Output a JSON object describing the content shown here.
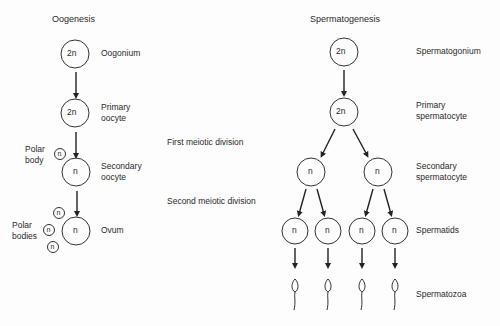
{
  "oogenesis": {
    "title": "Oogenesis",
    "stages": [
      {
        "label": "Oogonium",
        "ploidy": "2n"
      },
      {
        "label_line1": "Primary",
        "label_line2": "oocyte",
        "ploidy": "2n"
      },
      {
        "label_line1": "Secondary",
        "label_line2": "oocyte",
        "ploidy": "n"
      },
      {
        "label": "Ovum",
        "ploidy": "n"
      }
    ],
    "polar_body": {
      "line1": "Polar",
      "line2": "body",
      "ploidy": "n"
    },
    "polar_bodies": {
      "line1": "Polar",
      "line2": "bodies",
      "ploidy": "n"
    }
  },
  "divisions": {
    "first": "First meiotic division",
    "second": "Second meiotic division"
  },
  "spermatogenesis": {
    "title": "Spermatogenesis",
    "stages": [
      {
        "label": "Spermatogonium",
        "ploidy": "2n"
      },
      {
        "label_line1": "Primary",
        "label_line2": "spermatocyte",
        "ploidy": "2n"
      },
      {
        "label_line1": "Secondary",
        "label_line2": "spermatocyte",
        "ploidy": "n"
      },
      {
        "label": "Spermatids",
        "ploidy": "n"
      },
      {
        "label": "Spermatozoa"
      }
    ]
  }
}
